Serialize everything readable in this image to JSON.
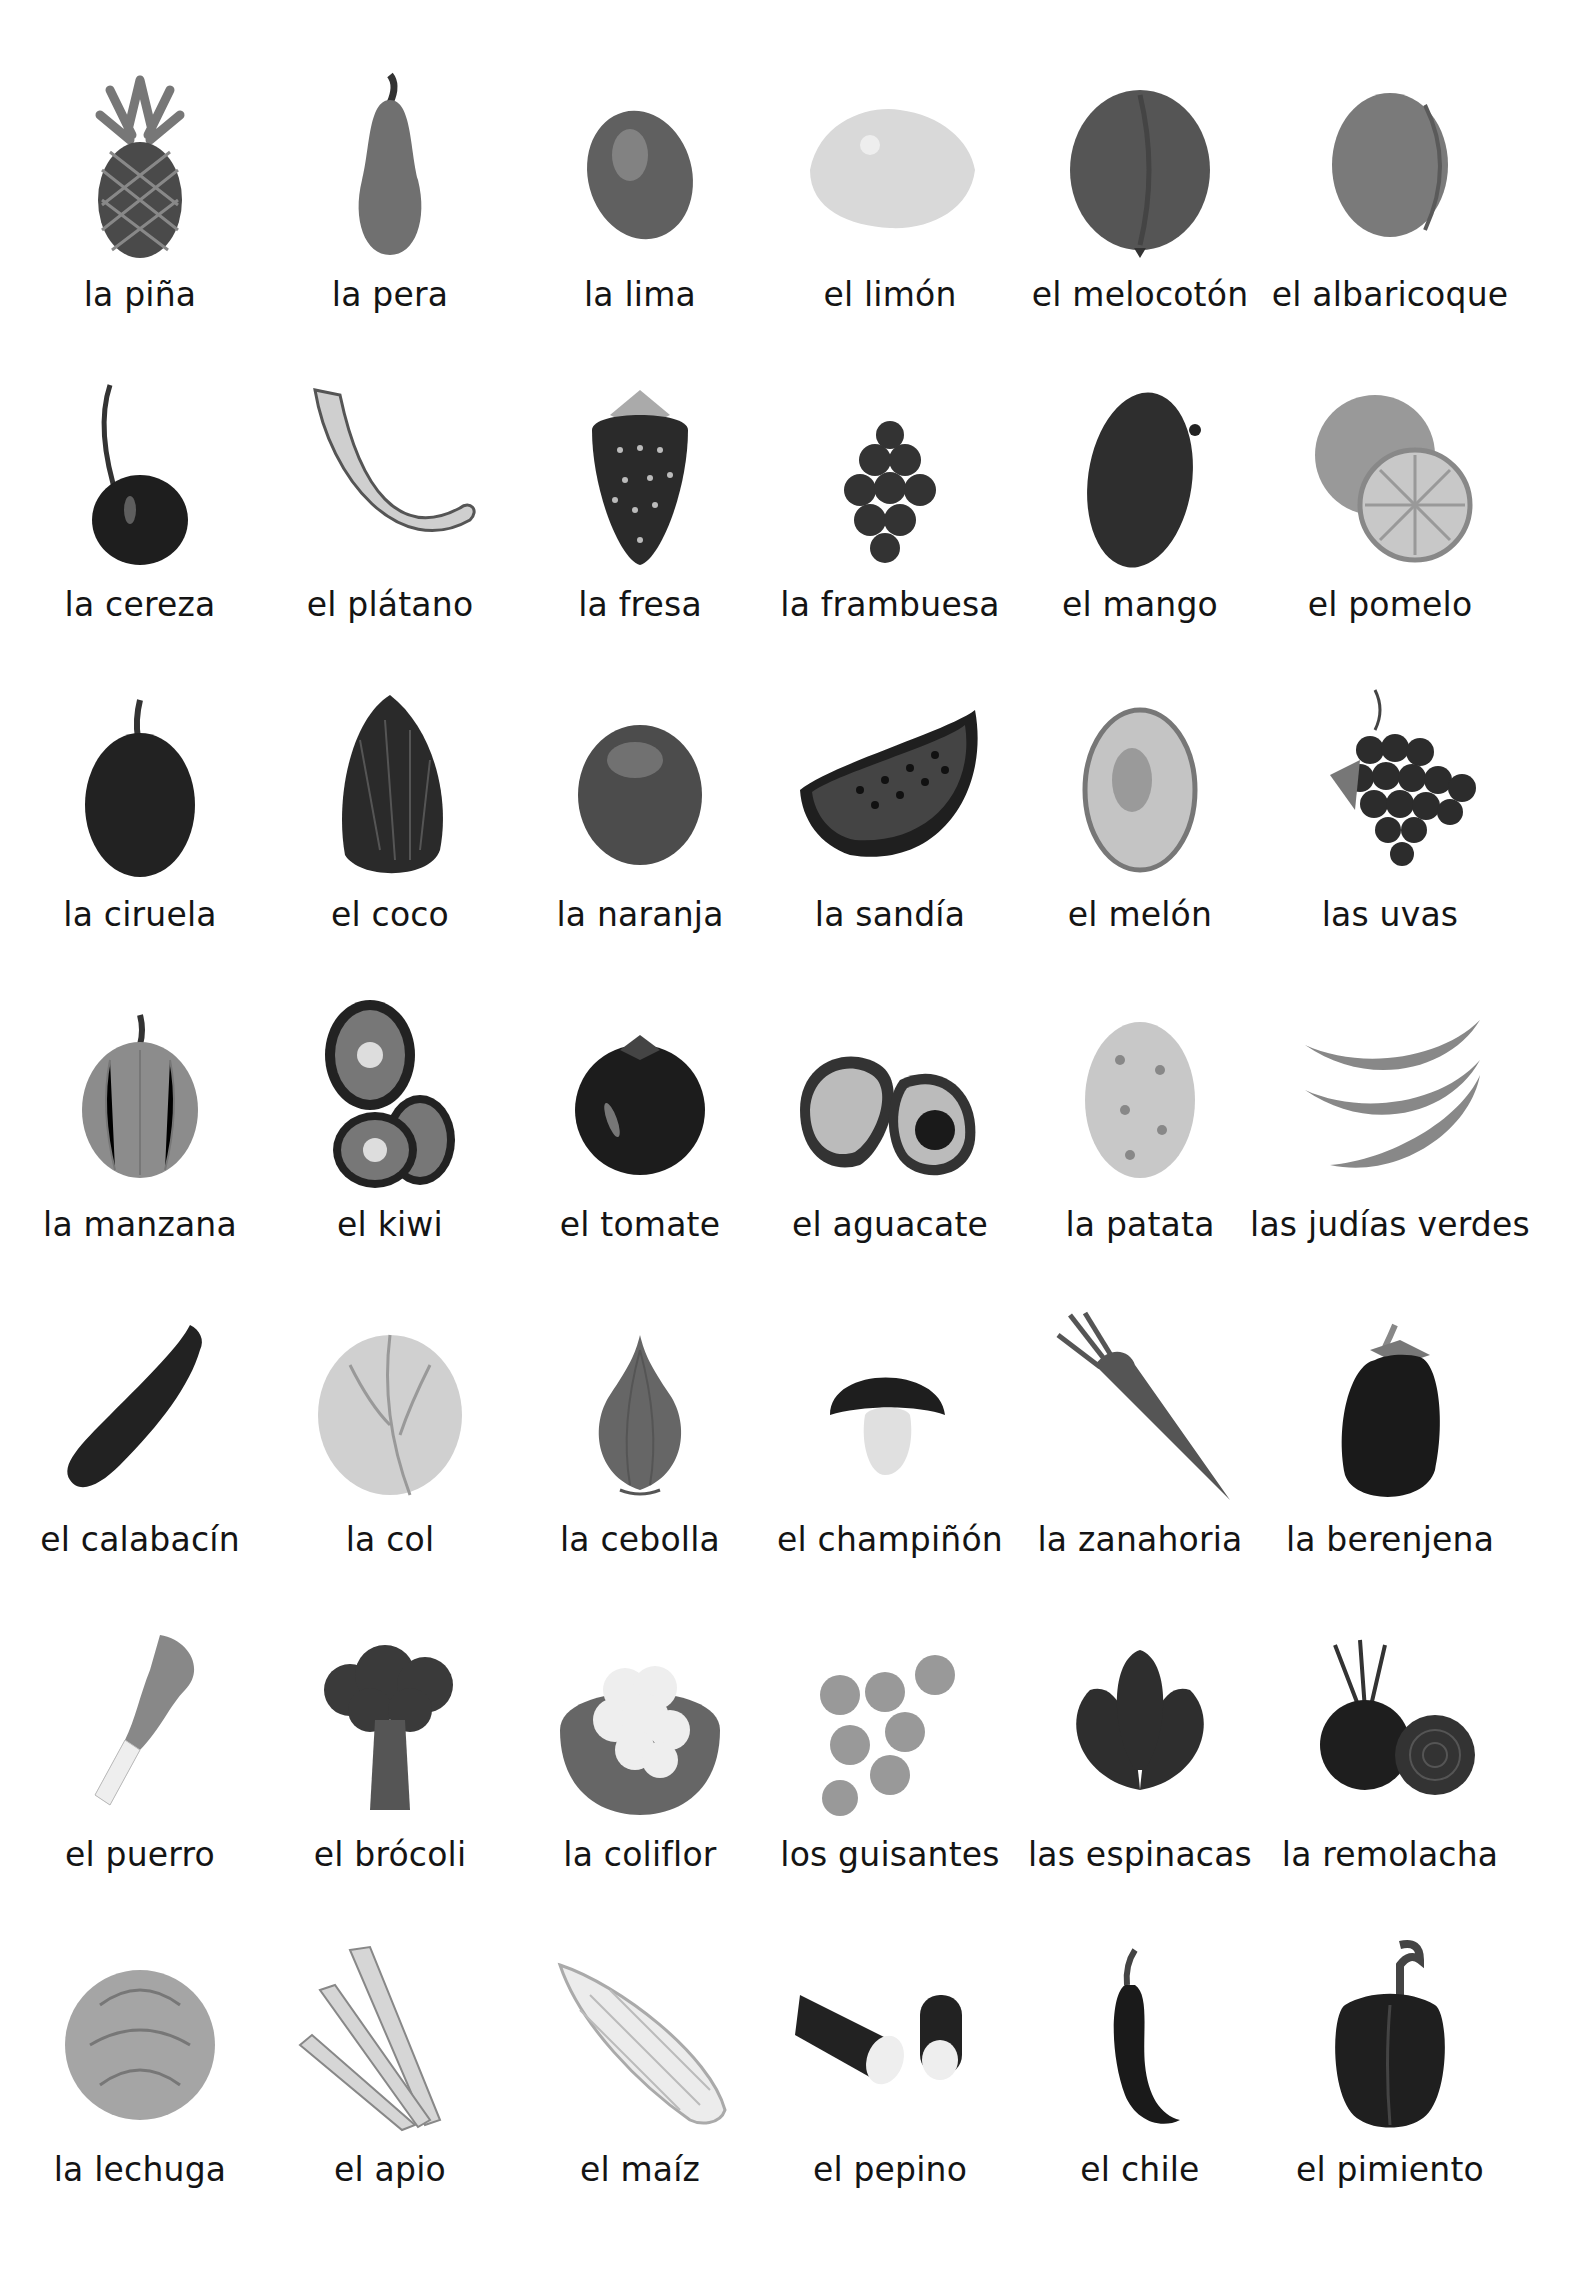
{
  "page": {
    "title": "",
    "background": "#ffffff",
    "columns": 6,
    "rows": 8
  },
  "items": [
    {
      "label": "la piña",
      "icon": "pineapple",
      "row": 0,
      "col": 0
    },
    {
      "label": "la pera",
      "icon": "pear",
      "row": 0,
      "col": 1
    },
    {
      "label": "la lima",
      "icon": "lime",
      "row": 0,
      "col": 2
    },
    {
      "label": "el limón",
      "icon": "lemon",
      "row": 0,
      "col": 3
    },
    {
      "label": "el melocotón",
      "icon": "peach",
      "row": 0,
      "col": 4
    },
    {
      "label": "el albaricoque",
      "icon": "apricot",
      "row": 0,
      "col": 5
    },
    {
      "label": "la cereza",
      "icon": "cherry",
      "row": 1,
      "col": 0
    },
    {
      "label": "el plátano",
      "icon": "banana",
      "row": 1,
      "col": 1
    },
    {
      "label": "la fresa",
      "icon": "strawberry",
      "row": 1,
      "col": 2
    },
    {
      "label": "la frambuesa",
      "icon": "raspberry",
      "row": 1,
      "col": 3
    },
    {
      "label": "el mango",
      "icon": "mango",
      "row": 1,
      "col": 4
    },
    {
      "label": "el pomelo",
      "icon": "grapefruit",
      "row": 1,
      "col": 5
    },
    {
      "label": "la ciruela",
      "icon": "plum",
      "row": 2,
      "col": 0
    },
    {
      "label": "el coco",
      "icon": "coconut",
      "row": 2,
      "col": 1
    },
    {
      "label": "la naranja",
      "icon": "orange",
      "row": 2,
      "col": 2
    },
    {
      "label": "la sandía",
      "icon": "watermelon",
      "row": 2,
      "col": 3
    },
    {
      "label": "el melón",
      "icon": "melon",
      "row": 2,
      "col": 4
    },
    {
      "label": "las uvas",
      "icon": "grapes",
      "row": 2,
      "col": 5
    },
    {
      "label": "la manzana",
      "icon": "apple",
      "row": 3,
      "col": 0
    },
    {
      "label": "el kiwi",
      "icon": "kiwi",
      "row": 3,
      "col": 1
    },
    {
      "label": "el tomate",
      "icon": "tomato",
      "row": 3,
      "col": 2
    },
    {
      "label": "el aguacate",
      "icon": "avocado",
      "row": 3,
      "col": 3
    },
    {
      "label": "la patata",
      "icon": "potato",
      "row": 3,
      "col": 4
    },
    {
      "label": "las judías verdes",
      "icon": "green-beans",
      "row": 3,
      "col": 5
    },
    {
      "label": "el calabacín",
      "icon": "zucchini",
      "row": 4,
      "col": 0
    },
    {
      "label": "la col",
      "icon": "cabbage",
      "row": 4,
      "col": 1
    },
    {
      "label": "la cebolla",
      "icon": "onion",
      "row": 4,
      "col": 2
    },
    {
      "label": "el champiñón",
      "icon": "mushroom",
      "row": 4,
      "col": 3
    },
    {
      "label": "la zanahoria",
      "icon": "carrot",
      "row": 4,
      "col": 4
    },
    {
      "label": "la berenjena",
      "icon": "eggplant",
      "row": 4,
      "col": 5
    },
    {
      "label": "el puerro",
      "icon": "leek",
      "row": 5,
      "col": 0
    },
    {
      "label": "el brócoli",
      "icon": "broccoli",
      "row": 5,
      "col": 1
    },
    {
      "label": "la coliflor",
      "icon": "cauliflower",
      "row": 5,
      "col": 2
    },
    {
      "label": "los guisantes",
      "icon": "peas",
      "row": 5,
      "col": 3
    },
    {
      "label": "las espinacas",
      "icon": "spinach",
      "row": 5,
      "col": 4
    },
    {
      "label": "la remolacha",
      "icon": "beetroot",
      "row": 5,
      "col": 5
    },
    {
      "label": "la lechuga",
      "icon": "lettuce",
      "row": 6,
      "col": 0
    },
    {
      "label": "el apio",
      "icon": "celery",
      "row": 6,
      "col": 1
    },
    {
      "label": "el maíz",
      "icon": "corn",
      "row": 6,
      "col": 2
    },
    {
      "label": "el pepino",
      "icon": "cucumber",
      "row": 6,
      "col": 3
    },
    {
      "label": "el chile",
      "icon": "chili",
      "row": 6,
      "col": 4
    },
    {
      "label": "el pimiento",
      "icon": "bell-pepper",
      "row": 6,
      "col": 5
    }
  ]
}
